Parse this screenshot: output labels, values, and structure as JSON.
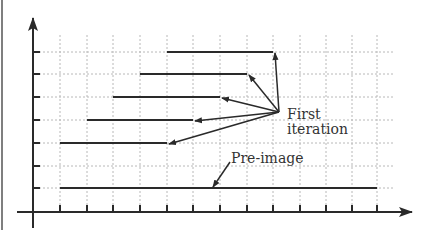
{
  "diagram": {
    "type": "iterated-segments",
    "labels": {
      "first_line1": "First",
      "first_line2": "iteration",
      "preimage": "Pre-image"
    },
    "axes": {
      "origin": [
        33,
        212
      ],
      "x_end": 412,
      "y_top": 18,
      "x_ticks": [
        60,
        87,
        113,
        140,
        167,
        193,
        220,
        247,
        273,
        300,
        326,
        352,
        377
      ],
      "y_ticks": [
        188,
        166,
        143,
        120,
        97,
        74,
        52
      ]
    },
    "grid": {
      "x_lines": [
        60,
        87,
        113,
        140,
        167,
        193,
        220,
        247,
        273,
        300,
        326,
        352,
        377
      ],
      "y_lines": [
        188,
        166,
        143,
        120,
        97,
        74,
        52
      ],
      "x_extent": [
        35,
        393
      ],
      "y_extent": [
        35,
        210
      ]
    },
    "preimage_segment": {
      "y": 188,
      "x1": 60,
      "x2": 377
    },
    "iteration_segments": [
      {
        "y": 143,
        "x1": 60,
        "x2": 167
      },
      {
        "y": 120,
        "x1": 87,
        "x2": 193
      },
      {
        "y": 97,
        "x1": 113,
        "x2": 220
      },
      {
        "y": 74,
        "x1": 140,
        "x2": 247
      },
      {
        "y": 52,
        "x1": 167,
        "x2": 273
      }
    ],
    "first_arrow_source": [
      279,
      112
    ],
    "first_arrow_targets": [
      [
        167,
        143
      ],
      [
        193,
        120
      ],
      [
        220,
        97
      ],
      [
        247,
        74
      ],
      [
        273,
        52
      ]
    ],
    "preimage_arrow": {
      "from": [
        230,
        162
      ],
      "to": [
        213,
        187
      ]
    },
    "colors": {
      "line": "#2a2a2a",
      "grid": "#b0b0b0",
      "text": "#333333"
    }
  }
}
